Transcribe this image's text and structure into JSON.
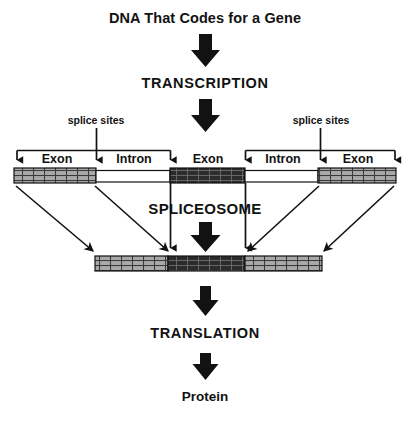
{
  "diagram": {
    "title": "DNA That Codes for a Gene",
    "type": "flowchart",
    "background_color": "#ffffff",
    "ink_color": "#121212",
    "steps": [
      {
        "id": "dna",
        "label": "DNA That Codes for a Gene",
        "kind": "title"
      },
      {
        "id": "transcription",
        "label": "TRANSCRIPTION",
        "kind": "process"
      },
      {
        "id": "spliceosome",
        "label": "SPLICEOSOME",
        "kind": "process"
      },
      {
        "id": "translation",
        "label": "TRANSLATION",
        "kind": "process"
      },
      {
        "id": "protein",
        "label": "Protein",
        "kind": "product"
      }
    ],
    "splice_site_labels": [
      {
        "id": "splice-sites-left",
        "label": "splice sites"
      },
      {
        "id": "splice-sites-right",
        "label": "splice sites"
      }
    ],
    "pre_mrna": {
      "name": "pre-mRNA transcript",
      "segments": [
        {
          "label": "Exon",
          "type": "exon",
          "shade": "light"
        },
        {
          "label": "Intron",
          "type": "intron",
          "shade": "white"
        },
        {
          "label": "Exon",
          "type": "exon",
          "shade": "dark"
        },
        {
          "label": "Intron",
          "type": "intron",
          "shade": "white"
        },
        {
          "label": "Exon",
          "type": "exon",
          "shade": "light"
        }
      ]
    },
    "mature_mrna": {
      "name": "mature mRNA",
      "segments": [
        {
          "type": "exon",
          "shade": "light"
        },
        {
          "type": "exon",
          "shade": "dark"
        },
        {
          "type": "exon",
          "shade": "light"
        }
      ]
    },
    "colors": {
      "exon_light_fill": "#a8a8a8",
      "exon_dark_fill": "#2b2b2b",
      "intron_fill": "#ffffff",
      "outline": "#111111",
      "arrow": "#121212"
    }
  }
}
